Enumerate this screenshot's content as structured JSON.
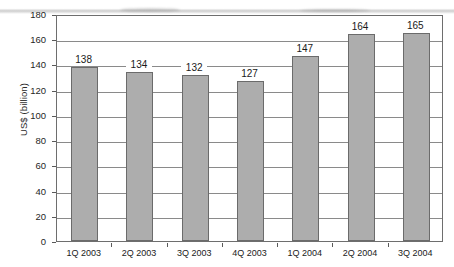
{
  "chart_data": {
    "type": "bar",
    "title": "",
    "subtitle": "",
    "xlabel": "",
    "ylabel": "US$ (billion)",
    "categories": [
      "1Q 2003",
      "2Q 2003",
      "3Q 2003",
      "4Q 2003",
      "1Q 2004",
      "2Q 2004",
      "3Q 2004"
    ],
    "values": [
      138,
      134,
      132,
      127,
      147,
      164,
      165
    ],
    "value_labels": [
      "138",
      "134",
      "132",
      "127",
      "147",
      "164",
      "165"
    ],
    "ylim": [
      0,
      180
    ],
    "ytick_step": 20,
    "yticks": [
      180,
      160,
      140,
      120,
      100,
      80,
      60,
      40,
      20,
      0
    ],
    "ytick_labels": [
      "180",
      "160",
      "140",
      "120",
      "100",
      "80",
      "60",
      "40",
      "20",
      "0"
    ],
    "grid": true,
    "grid_axis": "y",
    "legend": false,
    "legend_position": "none",
    "bar_color": "#adadad",
    "bar_edge_color": "#6b6b6b",
    "grid_color": "#8a8a8a",
    "axis_color": "#6e6e6e",
    "text_color": "#1a1a1a",
    "background_color": "#ffffff",
    "data_labels_shown": true
  }
}
